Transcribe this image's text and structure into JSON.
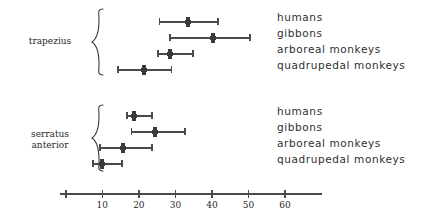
{
  "chart_data": {
    "type": "scatter",
    "title": "",
    "subtitle": "",
    "xlabel": "",
    "ylabel": "",
    "xlim": [
      -1.5,
      70
    ],
    "grid": false,
    "legend_position": "right-inline",
    "axis": {
      "ticks": [
        10,
        20,
        30,
        40,
        50,
        60
      ],
      "tick_labels": [
        "10",
        "20",
        "30",
        "40",
        "50",
        "60"
      ],
      "origin_tick": 0,
      "line_start": -1.5,
      "line_end": 70
    },
    "groups": [
      {
        "name": "trapezius",
        "label": "trapezius",
        "series": [
          {
            "name": "humans",
            "mean": 33.4,
            "low": 25.7,
            "high": 41.6
          },
          {
            "name": "gibbons",
            "mean": 40.3,
            "low": 28.5,
            "high": 50.4
          },
          {
            "name": "arboreal monkeys",
            "mean": 28.5,
            "low": 25.2,
            "high": 34.8
          },
          {
            "name": "quadrupedal monkeys",
            "mean": 21.4,
            "low": 14.3,
            "high": 29.0
          }
        ]
      },
      {
        "name": "serratus anterior",
        "label": "serratus\nanterior",
        "series": [
          {
            "name": "humans",
            "mean": 18.7,
            "low": 16.7,
            "high": 23.6
          },
          {
            "name": "gibbons",
            "mean": 24.4,
            "low": 18.0,
            "high": 32.6
          },
          {
            "name": "arboreal monkeys",
            "mean": 15.7,
            "low": 9.4,
            "high": 23.6
          },
          {
            "name": "quadrupedal monkeys",
            "mean": 9.9,
            "low": 7.4,
            "high": 15.4
          }
        ]
      }
    ],
    "colors": {
      "marker": "#3a3a3a",
      "whisker": "#4a4a4a",
      "axis": "#4a4a4a",
      "text": "#2f2f2f"
    }
  }
}
